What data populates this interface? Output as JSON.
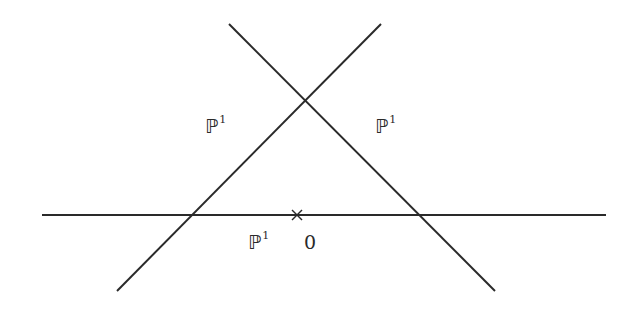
{
  "diagram": {
    "title": "",
    "stroke_color": "#2a2a2a",
    "lines": [
      {
        "name": "line-descending",
        "x1": 229,
        "y1": 24,
        "x2": 495,
        "y2": 291
      },
      {
        "name": "line-ascending",
        "x1": 381,
        "y1": 24,
        "x2": 117,
        "y2": 291
      },
      {
        "name": "line-horizontal",
        "x1": 42,
        "y1": 215,
        "x2": 606,
        "y2": 215
      }
    ],
    "marker": {
      "name": "origin-cross",
      "x": 297,
      "y": 215,
      "size": 5
    },
    "labels": [
      {
        "id": "left",
        "base": "ℙ",
        "sup": "1",
        "x": 205,
        "y": 117
      },
      {
        "id": "right",
        "base": "ℙ",
        "sup": "1",
        "x": 375,
        "y": 117
      },
      {
        "id": "bottom",
        "base": "ℙ",
        "sup": "1",
        "x": 248,
        "y": 233
      },
      {
        "id": "origin",
        "base": "0",
        "sup": "",
        "x": 304,
        "y": 233
      }
    ]
  }
}
